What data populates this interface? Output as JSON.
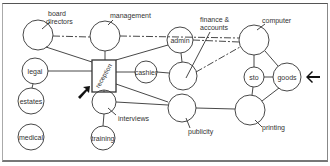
{
  "diagram": {
    "type": "network diagram of departments",
    "nodes": [
      {
        "id": "board_directors",
        "label": "board directors",
        "label_lines": [
          "board",
          "directors"
        ],
        "label_position": "outside"
      },
      {
        "id": "management",
        "label": "management",
        "label_position": "outside"
      },
      {
        "id": "admin",
        "label": "admin",
        "label_position": "inside"
      },
      {
        "id": "finance",
        "label": "finance & accounts",
        "label_lines": [
          "finance &",
          "accounts"
        ],
        "label_position": "outside"
      },
      {
        "id": "computer",
        "label": "computer",
        "label_position": "outside"
      },
      {
        "id": "legal",
        "label": "legal",
        "label_position": "inside"
      },
      {
        "id": "estates",
        "label": "estates",
        "label_position": "inside"
      },
      {
        "id": "medical",
        "label": "medical",
        "label_position": "inside"
      },
      {
        "id": "reception",
        "label": "reception",
        "label_position": "inside",
        "shape": "square"
      },
      {
        "id": "cashier",
        "label": "cashier",
        "label_position": "inside"
      },
      {
        "id": "interviews",
        "label": "interviews",
        "label_position": "outside"
      },
      {
        "id": "training",
        "label": "training",
        "label_position": "inside"
      },
      {
        "id": "publicity",
        "label": "publicity",
        "label_position": "outside"
      },
      {
        "id": "sto",
        "label": "sto",
        "label_position": "inside"
      },
      {
        "id": "goods",
        "label": "goods",
        "label_position": "inside"
      },
      {
        "id": "printing",
        "label": "printing",
        "label_position": "outside"
      }
    ],
    "edges": [
      {
        "from": "board_directors",
        "to": "management",
        "style": "dashed"
      },
      {
        "from": "management",
        "to": "computer",
        "style": "dashed"
      },
      {
        "from": "admin",
        "to": "computer",
        "style": "dashed"
      },
      {
        "from": "finance",
        "to": "computer",
        "style": "dashed"
      },
      {
        "from": "board_directors",
        "to": "reception",
        "style": "solid"
      },
      {
        "from": "management",
        "to": "reception",
        "style": "solid"
      },
      {
        "from": "reception",
        "to": "admin",
        "style": "solid"
      },
      {
        "from": "admin",
        "to": "finance",
        "style": "solid"
      },
      {
        "from": "legal",
        "to": "reception",
        "style": "solid"
      },
      {
        "from": "legal",
        "to": "estates",
        "style": "solid"
      },
      {
        "from": "reception",
        "to": "cashier",
        "style": "solid"
      },
      {
        "from": "cashier",
        "to": "finance",
        "style": "solid"
      },
      {
        "from": "reception",
        "to": "interviews",
        "style": "solid"
      },
      {
        "from": "reception",
        "to": "publicity",
        "style": "solid"
      },
      {
        "from": "interviews",
        "to": "training",
        "style": "solid"
      },
      {
        "from": "interviews",
        "to": "publicity",
        "style": "solid"
      },
      {
        "from": "publicity",
        "to": "printing",
        "style": "solid"
      },
      {
        "from": "computer",
        "to": "sto",
        "style": "solid"
      },
      {
        "from": "computer",
        "to": "goods",
        "style": "solid"
      },
      {
        "from": "sto",
        "to": "goods",
        "style": "solid"
      },
      {
        "from": "sto",
        "to": "printing",
        "style": "solid"
      },
      {
        "from": "goods",
        "to": "printing",
        "style": "solid"
      }
    ],
    "arrows": [
      {
        "id": "reception-pointer",
        "direction": "up-right",
        "points_to": "reception"
      },
      {
        "id": "goods-pointer",
        "direction": "left",
        "points_to": "goods"
      }
    ],
    "colors": {
      "line": "#333333",
      "text": "#333333",
      "background": "#ffffff",
      "arrow": "#111111"
    }
  }
}
